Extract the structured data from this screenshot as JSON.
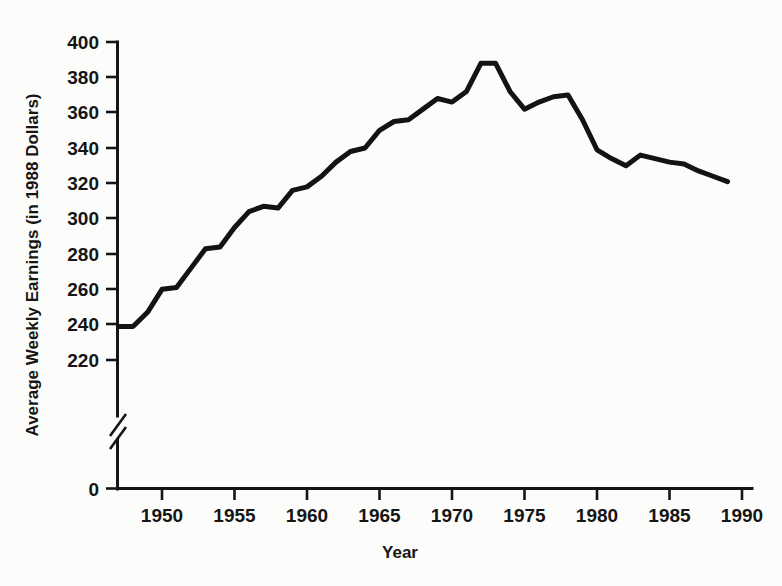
{
  "chart_data": {
    "type": "line",
    "title": "",
    "xlabel": "Year",
    "ylabel": "Average Weekly Earnings (in 1988 Dollars)",
    "xlim": [
      1947,
      1990
    ],
    "ylim": [
      220,
      400
    ],
    "y_axis_break": true,
    "y_axis_break_note": "axis broken between 0 and 220",
    "grid": false,
    "legend": false,
    "xticks": [
      1950,
      1955,
      1960,
      1965,
      1970,
      1975,
      1980,
      1985,
      1990
    ],
    "xtick_labels": [
      "1950",
      "1955",
      "1960",
      "1965",
      "1970",
      "1975",
      "1980",
      "1985",
      "1990"
    ],
    "yticks": [
      0,
      220,
      240,
      260,
      280,
      300,
      320,
      340,
      360,
      380,
      400
    ],
    "ytick_labels": [
      "0",
      "220",
      "240",
      "260",
      "280",
      "300",
      "320",
      "340",
      "360",
      "380",
      "400"
    ],
    "series": [
      {
        "name": "Average Weekly Earnings",
        "color": "#131313",
        "x": [
          1947,
          1948,
          1949,
          1950,
          1951,
          1952,
          1953,
          1954,
          1955,
          1956,
          1957,
          1958,
          1959,
          1960,
          1961,
          1962,
          1963,
          1964,
          1965,
          1966,
          1967,
          1968,
          1969,
          1970,
          1971,
          1972,
          1973,
          1974,
          1975,
          1976,
          1977,
          1978,
          1979,
          1980,
          1981,
          1982,
          1983,
          1984,
          1985,
          1986,
          1987,
          1988,
          1989
        ],
        "values": [
          239,
          239,
          247,
          260,
          261,
          272,
          283,
          284,
          295,
          304,
          307,
          306,
          316,
          318,
          324,
          332,
          338,
          340,
          350,
          355,
          356,
          362,
          368,
          366,
          372,
          388,
          388,
          372,
          362,
          366,
          369,
          370,
          356,
          339,
          334,
          330,
          336,
          334,
          332,
          331,
          327,
          324,
          321
        ]
      }
    ],
    "annotations": []
  },
  "axis": {
    "x_title": "Year",
    "y_title": "Average Weekly Earnings (in 1988 Dollars)"
  },
  "ytick_text": {
    "t400": "400",
    "t380": "380",
    "t360": "360",
    "t340": "340",
    "t320": "320",
    "t300": "300",
    "t280": "280",
    "t260": "260",
    "t240": "240",
    "t220": "220",
    "t0": "0"
  },
  "xtick_text": {
    "t1950": "1950",
    "t1955": "1955",
    "t1960": "1960",
    "t1965": "1965",
    "t1970": "1970",
    "t1975": "1975",
    "t1980": "1980",
    "t1985": "1985",
    "t1990": "1990"
  },
  "colors": {
    "line": "#131313",
    "axis": "#151515",
    "background": "#fcfcfa"
  }
}
